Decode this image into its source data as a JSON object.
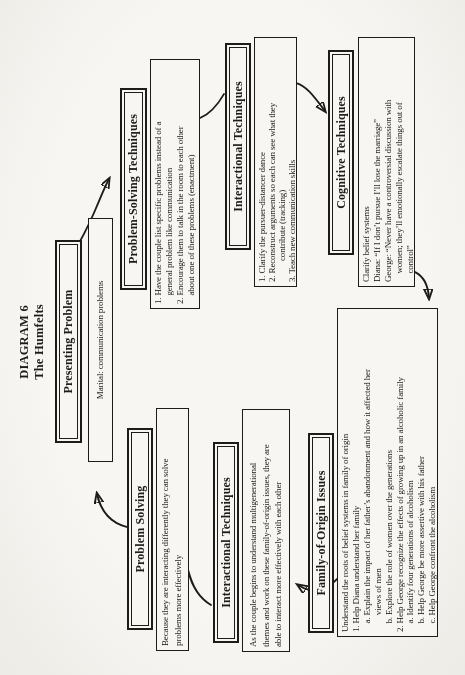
{
  "colors": {
    "paper": "#f4f3ef",
    "ink": "#1d1c1a"
  },
  "heading": {
    "line1": "DIAGRAM 6",
    "line2": "The Humfelts"
  },
  "nodes": {
    "presenting_problem": {
      "title": "Presenting Problem"
    },
    "marital": {
      "lines": [
        "Marital: communication problems"
      ]
    },
    "problem_solving_techniques": {
      "title": "Problem-Solving Techniques",
      "lines": [
        "1. Have the couple list specific problems instead of a",
        "    general problem like communication",
        "2. Encourage them to talk in the room to each other",
        "    about one of these problems (enactment)"
      ]
    },
    "interactional_techniques_1": {
      "title": "Interactional Techniques",
      "lines": [
        "1. Clarify the pursuer-distancer dance",
        "2. Reconstruct arguments so each can see what they",
        "          contribute (tracking)",
        "3. Teach new communication skills"
      ]
    },
    "cognitive_techniques": {
      "title": "Cognitive Techniques",
      "lines": [
        "Clarify belief systems",
        "Diana: “If I don’t pursue I’ll lose the marriage”",
        "George: “Never have a controversial discussion with",
        "    women; they’ll emotionally escalate things out of",
        "    control”"
      ]
    },
    "family_of_origin": {
      "title": "Family-of-Origin Issues",
      "lines": [
        "Understand the roots of belief systems in family of origin",
        "1. Help Diana understand her family",
        "    a. Explain the impact of her father’s abandonment and how it affected her",
        "        views of men",
        "    b. Explore the role of women over the generations",
        "2. Help George recognize the effects of growing up in an alcoholic family",
        "    a. Identify four generations of alcoholism",
        "    b. Help George be more assertive with his father",
        "    c. Help George confront the alcoholism"
      ]
    },
    "interactional_techniques_2": {
      "title": "Interactional Techniques",
      "lines": [
        "As the couple begins to understand multigenerational",
        "themes and work on these family-of-origin issues, they are",
        "able to interact more effectively with each other"
      ]
    },
    "problem_solving_2": {
      "title": "Problem Solving",
      "lines": [
        "Because they are interacting differently they can solve",
        "problems more effectively"
      ]
    }
  }
}
